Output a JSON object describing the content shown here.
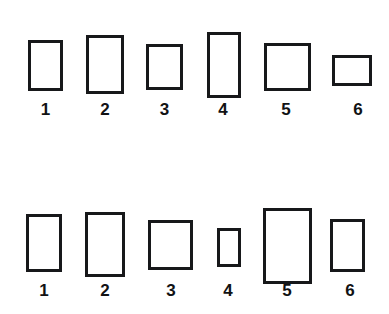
{
  "figure": {
    "background_color": "#ffffff",
    "stroke_color": "#17181a",
    "stroke_width_px": 3,
    "label_color": "#111214",
    "canvas": {
      "width": 389,
      "height": 314
    }
  },
  "chart_data": {
    "type": "table",
    "xlabel": "",
    "ylabel": "",
    "grid": false,
    "legend": "none",
    "columns": [
      "label",
      "x",
      "y",
      "width",
      "height"
    ],
    "rows": [
      {
        "row": "top",
        "label": "1",
        "x": 28,
        "y": 40,
        "width": 35,
        "height": 51
      },
      {
        "row": "top",
        "label": "2",
        "x": 86,
        "y": 35,
        "width": 38,
        "height": 59
      },
      {
        "row": "top",
        "label": "3",
        "x": 146,
        "y": 44,
        "width": 37,
        "height": 46
      },
      {
        "row": "top",
        "label": "4",
        "x": 207,
        "y": 32,
        "width": 34,
        "height": 66
      },
      {
        "row": "top",
        "label": "5",
        "x": 264,
        "y": 43,
        "width": 47,
        "height": 48
      },
      {
        "row": "top",
        "label": "6",
        "x": 332,
        "y": 55,
        "width": 40,
        "height": 31
      },
      {
        "row": "bottom",
        "label": "1",
        "x": 26,
        "y": 214,
        "width": 36,
        "height": 58
      },
      {
        "row": "bottom",
        "label": "2",
        "x": 85,
        "y": 212,
        "width": 40,
        "height": 65
      },
      {
        "row": "bottom",
        "label": "3",
        "x": 148,
        "y": 220,
        "width": 45,
        "height": 50
      },
      {
        "row": "bottom",
        "label": "4",
        "x": 217,
        "y": 228,
        "width": 24,
        "height": 39
      },
      {
        "row": "bottom",
        "label": "5",
        "x": 263,
        "y": 208,
        "width": 49,
        "height": 76
      },
      {
        "row": "bottom",
        "label": "6",
        "x": 330,
        "y": 219,
        "width": 35,
        "height": 53
      }
    ]
  },
  "rows": [
    {
      "name": "top-row",
      "shapes": [
        {
          "label": "1",
          "x": 28,
          "y": 40,
          "w": 35,
          "h": 51,
          "label_x": 28,
          "label_w": 35,
          "label_y": 100
        },
        {
          "label": "2",
          "x": 86,
          "y": 35,
          "w": 38,
          "h": 59,
          "label_x": 86,
          "label_w": 38,
          "label_y": 100
        },
        {
          "label": "3",
          "x": 146,
          "y": 44,
          "w": 37,
          "h": 46,
          "label_x": 146,
          "label_w": 37,
          "label_y": 100
        },
        {
          "label": "4",
          "x": 207,
          "y": 32,
          "w": 34,
          "h": 66,
          "label_x": 205,
          "label_w": 36,
          "label_y": 100
        },
        {
          "label": "5",
          "x": 264,
          "y": 43,
          "w": 47,
          "h": 48,
          "label_x": 266,
          "label_w": 40,
          "label_y": 100
        },
        {
          "label": "6",
          "x": 332,
          "y": 55,
          "w": 40,
          "h": 31,
          "label_x": 338,
          "label_w": 40,
          "label_y": 100
        }
      ]
    },
    {
      "name": "bottom-row",
      "shapes": [
        {
          "label": "1",
          "x": 26,
          "y": 214,
          "w": 36,
          "h": 58,
          "label_x": 26,
          "label_w": 36,
          "label_y": 281
        },
        {
          "label": "2",
          "x": 85,
          "y": 212,
          "w": 40,
          "h": 65,
          "label_x": 85,
          "label_w": 40,
          "label_y": 281
        },
        {
          "label": "3",
          "x": 148,
          "y": 220,
          "w": 45,
          "h": 50,
          "label_x": 151,
          "label_w": 40,
          "label_y": 281
        },
        {
          "label": "4",
          "x": 217,
          "y": 228,
          "w": 24,
          "h": 39,
          "label_x": 209,
          "label_w": 38,
          "label_y": 281
        },
        {
          "label": "5",
          "x": 263,
          "y": 208,
          "w": 49,
          "h": 76,
          "label_x": 267,
          "label_w": 40,
          "label_y": 281
        },
        {
          "label": "6",
          "x": 330,
          "y": 219,
          "w": 35,
          "h": 53,
          "label_x": 331,
          "label_w": 38,
          "label_y": 281
        }
      ]
    }
  ]
}
